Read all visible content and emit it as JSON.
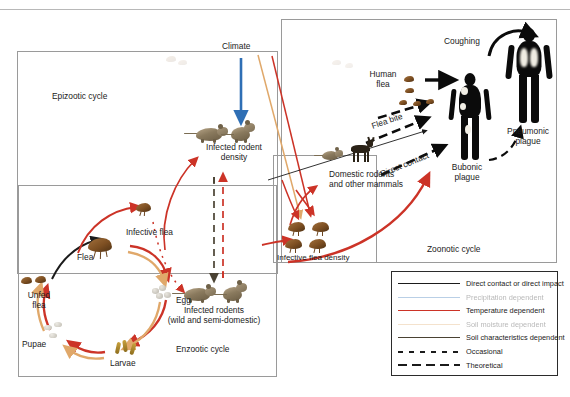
{
  "figure": {
    "top_rule": true
  },
  "cycles": {
    "epizootic": {
      "label": "Epizootic cycle"
    },
    "enzootic": {
      "label": "Enzootic cycle"
    },
    "zoonotic": {
      "label": "Zoonotic cycle"
    }
  },
  "nodes": {
    "climate": "Climate",
    "infected_rodent_density": "Infected rodent\ndensity",
    "infected_rodent_density_l1": "Infected rodent",
    "infected_rodent_density_l2": "density",
    "infective_flea": "Infective flea",
    "flea": "Flea",
    "unfed_flea_l1": "Unfed",
    "unfed_flea_l2": "flea",
    "egg": "Egg",
    "larvae": "Larvae",
    "pupae": "Pupae",
    "infected_rodents_l1": "Infected rodents",
    "infected_rodents_l2": "(wild and semi-domestic)",
    "infective_flea_density": "Infective flea density",
    "domestic_rodents_l1": "Domestic rodents",
    "domestic_rodents_l2": "and other mammals",
    "human_flea_l1": "Human",
    "human_flea_l2": "flea",
    "flea_bite": "Flea bite",
    "direct_contact": "Direct contact",
    "coughing": "Coughing",
    "bubonic_l1": "Bubonic",
    "bubonic_l2": "plague",
    "pneumonic_l1": "Pneumonic",
    "pneumonic_l2": "plague"
  },
  "legend": {
    "items": [
      {
        "label": "Direct contact or direct impact",
        "color": "#1b1b1b",
        "style": "solid",
        "faded": false
      },
      {
        "label": "Precipitation dependent",
        "color": "#2f6fb5",
        "style": "solid",
        "faded": true
      },
      {
        "label": "Temperature dependent",
        "color": "#cc3327",
        "style": "solid",
        "faded": false
      },
      {
        "label": "Soil moisture dependent",
        "color": "#e0a86a",
        "style": "solid",
        "faded": true
      },
      {
        "label": "Soil characteristics dependent",
        "color": "#4a4233",
        "style": "solid",
        "faded": false
      },
      {
        "label": "Occasional",
        "color": "#1b1b1b",
        "style": "dotted",
        "faded": false
      },
      {
        "label": "Theoretical",
        "color": "#1b1b1b",
        "style": "dashed",
        "faded": false
      }
    ]
  },
  "colors": {
    "black": "#1b1b1b",
    "blue": "#2f6fb5",
    "red": "#cc3327",
    "tan": "#e0a86a",
    "olive": "#4a4233",
    "box_border": "#9a9a9a"
  }
}
